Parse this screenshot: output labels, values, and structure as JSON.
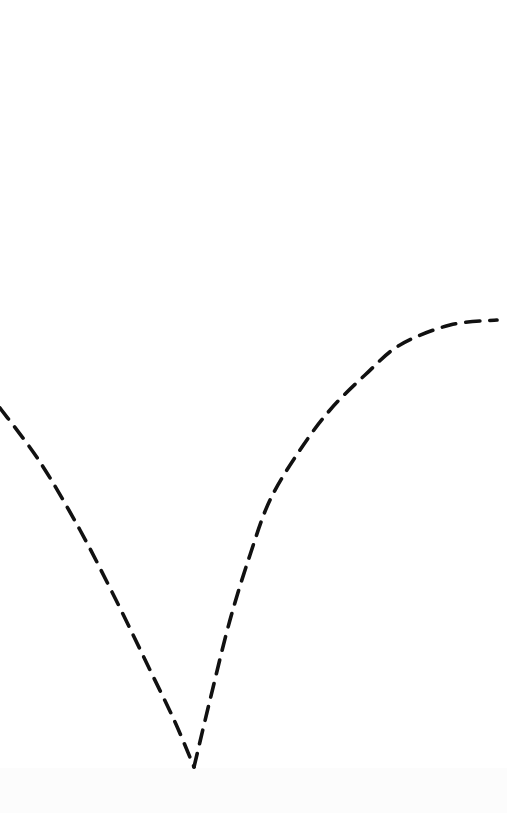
{
  "diagram": {
    "background_color": "#ffffff",
    "stroke_color": "#111111",
    "stroke_width": 3.6,
    "dash_pattern": "14 10",
    "curves": [
      {
        "name": "left-arm",
        "points": [
          [
            0,
            408
          ],
          [
            40,
            462
          ],
          [
            80,
            530
          ],
          [
            115,
            598
          ],
          [
            150,
            670
          ],
          [
            175,
            722
          ],
          [
            194,
            767
          ]
        ]
      },
      {
        "name": "right-arm",
        "points": [
          [
            194,
            767
          ],
          [
            210,
            700
          ],
          [
            230,
            620
          ],
          [
            250,
            555
          ],
          [
            270,
            500
          ],
          [
            300,
            450
          ],
          [
            330,
            410
          ],
          [
            365,
            375
          ],
          [
            400,
            345
          ],
          [
            450,
            325
          ],
          [
            497,
            320
          ]
        ]
      }
    ],
    "cusp_point": [
      194,
      767
    ],
    "labels": []
  }
}
